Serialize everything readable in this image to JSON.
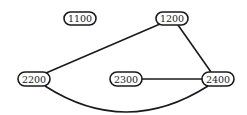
{
  "diagram": {
    "type": "graph",
    "nodes": [
      {
        "id": "1100",
        "label": "1100",
        "x": 80,
        "y": 18.5,
        "w": 32,
        "h": 13
      },
      {
        "id": "1200",
        "label": "1200",
        "x": 172,
        "y": 18.5,
        "w": 32,
        "h": 13
      },
      {
        "id": "2200",
        "label": "2200",
        "x": 34,
        "y": 79,
        "w": 32,
        "h": 14
      },
      {
        "id": "2300",
        "label": "2300",
        "x": 126,
        "y": 79,
        "w": 32,
        "h": 14
      },
      {
        "id": "2400",
        "label": "2400",
        "x": 218,
        "y": 79,
        "w": 32,
        "h": 14
      }
    ],
    "edges": [
      {
        "from": "2200",
        "to": "1200",
        "shape": "straight"
      },
      {
        "from": "1200",
        "to": "2400",
        "shape": "straight"
      },
      {
        "from": "2300",
        "to": "2400",
        "shape": "straight"
      },
      {
        "from": "2200",
        "to": "2400",
        "shape": "curved-below"
      }
    ]
  },
  "labels": {
    "n1100": "1100",
    "n1200": "1200",
    "n2200": "2200",
    "n2300": "2300",
    "n2400": "2400"
  }
}
